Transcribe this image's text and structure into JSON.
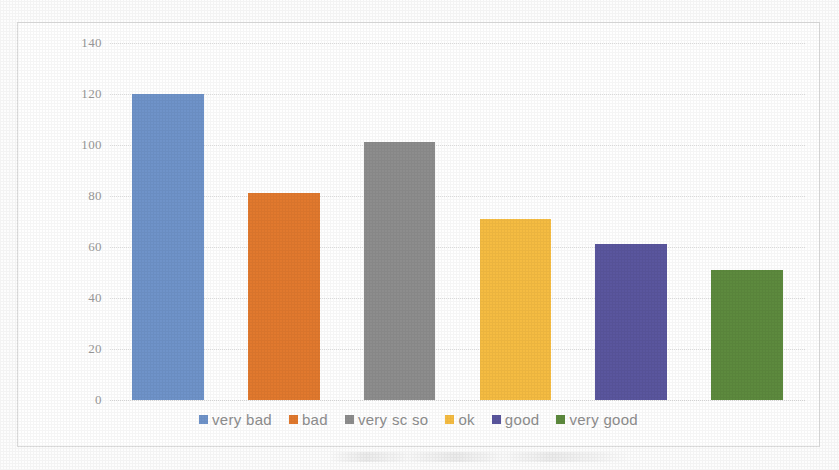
{
  "chart_data": {
    "type": "bar",
    "title": "",
    "subtitle": "",
    "xlabel": "",
    "ylabel": "",
    "categories": [
      "very bad",
      "bad",
      "very so so",
      "ok",
      "good",
      "very good"
    ],
    "values": [
      120,
      81,
      101,
      71,
      61,
      51
    ],
    "series": [
      {
        "name": "responses",
        "values": [
          120,
          81,
          101,
          71,
          61,
          51
        ]
      }
    ],
    "colors": [
      "#6f93c9",
      "#e1792e",
      "#8d8d8d",
      "#f5bc42",
      "#5a569e",
      "#5d8a3e"
    ],
    "ylim": [
      0,
      140
    ],
    "ytick_step": 20,
    "ytick_labels": [
      "0",
      "20",
      "40",
      "60",
      "80",
      "100",
      "120",
      "140"
    ],
    "ytick_values": [
      0,
      20,
      40,
      60,
      80,
      100,
      120,
      140
    ],
    "xtick_labels": [],
    "grid": true,
    "grid_axis": "y",
    "grid_style": "dotted",
    "legend": true,
    "legend_position": "bottom",
    "legend_orientation": "horizontal",
    "data_labels": false,
    "background_color": "#ffffff",
    "border_color": "#dcdcdc",
    "axis_label_color": "#9a9a9a",
    "legend_label_color": "#8e8e8e"
  },
  "legend": {
    "items": [
      {
        "label": "very bad",
        "color": "#6f93c9"
      },
      {
        "label": "bad",
        "color": "#e1792e"
      },
      {
        "label": "very sc so",
        "color": "#8d8d8d"
      },
      {
        "label": "ok",
        "color": "#f5bc42"
      },
      {
        "label": "good",
        "color": "#5a569e"
      },
      {
        "label": "very good",
        "color": "#5d8a3e"
      }
    ]
  },
  "axis": {
    "y_ticks": [
      {
        "label": "140",
        "value": 140
      },
      {
        "label": "120",
        "value": 120
      },
      {
        "label": "100",
        "value": 100
      },
      {
        "label": "80",
        "value": 80
      },
      {
        "label": "60",
        "value": 60
      },
      {
        "label": "40",
        "value": 40
      },
      {
        "label": "20",
        "value": 20
      },
      {
        "label": "0",
        "value": 0
      }
    ]
  }
}
